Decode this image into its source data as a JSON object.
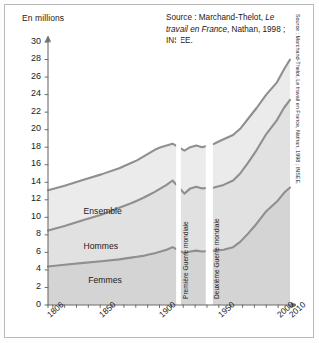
{
  "figure": {
    "axis_title": "En millions",
    "source_note_line1_plain": "Source : Marchand-Thelot, ",
    "source_note_line1_italic": "Le travail",
    "source_note_line2_italic": "en France",
    "source_note_line2_plain": ", Nathan, 1998 ; INSEE.",
    "source_side": "Source : Marchand-Thelot, Le travail en France, Nathan, 1998 ; INSEE."
  },
  "chart_data": {
    "type": "area",
    "stacked": true,
    "title": "",
    "subtitle": "",
    "xlabel": "",
    "ylabel": "En millions",
    "ylim": [
      0,
      30
    ],
    "xlim": [
      1806,
      2010
    ],
    "grid": false,
    "legend_position": "inline-labels",
    "ytick_labels": [
      "0",
      "2",
      "4",
      "6",
      "8",
      "10",
      "12",
      "14",
      "16",
      "18",
      "20",
      "22",
      "24",
      "26",
      "28",
      "30"
    ],
    "yticks": [
      0,
      2,
      4,
      6,
      8,
      10,
      12,
      14,
      16,
      18,
      20,
      22,
      24,
      26,
      28,
      30
    ],
    "xtick_labels": [
      "1806",
      "1850",
      "1900",
      "1950",
      "2000",
      "2010"
    ],
    "xticks": [
      1806,
      1850,
      1900,
      1950,
      2000,
      2010
    ],
    "x": [
      1806,
      1820,
      1836,
      1851,
      1866,
      1876,
      1881,
      1886,
      1891,
      1896,
      1901,
      1906,
      1911,
      1921,
      1926,
      1931,
      1936,
      1946,
      1954,
      1962,
      1968,
      1975,
      1982,
      1990,
      1999,
      2005,
      2010
    ],
    "series": [
      {
        "name": "Femmes",
        "label": "Femmes",
        "color": "#d4d4d4",
        "line_color": "#8f8f8f",
        "values": [
          4.4,
          4.6,
          4.8,
          5.0,
          5.2,
          5.4,
          5.5,
          5.6,
          5.75,
          5.9,
          6.1,
          6.3,
          6.6,
          5.9,
          6.1,
          6.2,
          6.1,
          6.2,
          6.3,
          6.6,
          7.2,
          8.2,
          9.3,
          10.7,
          11.8,
          12.8,
          13.4
        ]
      },
      {
        "name": "Hommes",
        "label": "Hommes",
        "color": "#e1e1e1",
        "line_color": "#8f8f8f",
        "values": [
          4.1,
          4.4,
          4.9,
          5.3,
          5.9,
          6.2,
          6.4,
          6.6,
          6.8,
          7.0,
          7.2,
          7.4,
          7.6,
          6.8,
          7.2,
          7.3,
          7.2,
          7.2,
          7.4,
          7.6,
          7.8,
          8.1,
          8.4,
          8.8,
          9.3,
          9.7,
          10.0
        ]
      }
    ],
    "total_series": {
      "name": "Ensemble",
      "label": "Ensemble",
      "color": "#ebebeb",
      "line_color": "#8f8f8f",
      "values": [
        13.1,
        13.6,
        14.3,
        14.9,
        15.6,
        16.2,
        16.5,
        16.9,
        17.3,
        17.7,
        18.0,
        18.2,
        18.4,
        17.6,
        18.0,
        18.2,
        18.0,
        18.4,
        18.9,
        19.4,
        20.1,
        21.3,
        22.5,
        24.0,
        25.4,
        26.9,
        28.0
      ]
    },
    "annotations": [
      {
        "name": "war1",
        "label": "Première Guerre mondiale",
        "x_start": 1914,
        "x_end": 1918
      },
      {
        "name": "war2",
        "label": "Deuxième Guerre mondiale",
        "x_start": 1939,
        "x_end": 1945
      }
    ]
  }
}
